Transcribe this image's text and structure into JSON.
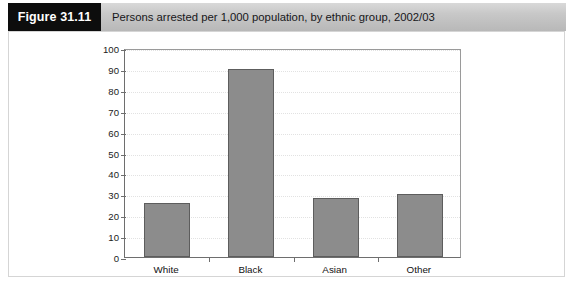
{
  "header": {
    "tag": "Figure 31.11",
    "caption": "Persons arrested per 1,000 population, by ethnic group, 2002/03"
  },
  "colors": {
    "tag_background": "#0d0d0d",
    "header_background": "#c8c8c8",
    "bar_fill": "#8c8c8c",
    "bar_stroke": "#5d5d5d",
    "axis": "#6e6e6e",
    "gridline": "#e2e2e2",
    "frame": "#d5d5d5",
    "plot_background": "#ffffff"
  },
  "chart_data": {
    "type": "bar",
    "title": "Persons arrested per 1,000 population, by ethnic group, 2002/03",
    "xlabel": "",
    "ylabel": "",
    "categories": [
      "White",
      "Black",
      "Asian",
      "Other"
    ],
    "values": [
      26,
      90,
      28,
      30
    ],
    "series": [
      {
        "name": "Persons arrested per 1,000 population",
        "values": [
          26,
          90,
          28,
          30
        ]
      }
    ],
    "ylim": [
      0,
      100
    ],
    "ytick_step": 10,
    "yticks": [
      0,
      10,
      20,
      30,
      40,
      50,
      60,
      70,
      80,
      90,
      100
    ],
    "ytick_labels": [
      "0",
      "10",
      "20",
      "30",
      "40",
      "50",
      "60",
      "70",
      "80",
      "90",
      "100"
    ],
    "grid": true,
    "grid_axis": "y",
    "grid_style": "dotted",
    "legend": false,
    "legend_position": "none"
  }
}
